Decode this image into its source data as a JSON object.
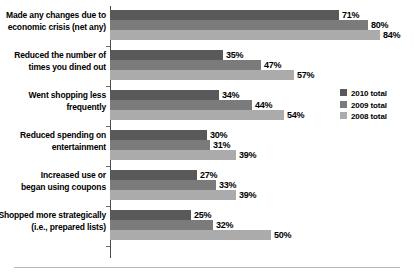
{
  "chart_data": {
    "type": "bar",
    "orientation": "horizontal",
    "title": "",
    "subtitle": "",
    "xlabel": "",
    "ylabel": "",
    "xlim": [
      0,
      90
    ],
    "grid": false,
    "legend_position": "middle-right",
    "value_suffix": "%",
    "categories": [
      "Made any changes due to economic crisis (net any)",
      "Reduced the number of times you dined out",
      "Went shopping less frequently",
      "Reduced spending on entertainment",
      "Increased use or began using coupons",
      "Shopped more strategically (i.e., prepared lists)"
    ],
    "category_lines": [
      [
        "Made any changes due to",
        "economic crisis (net any)"
      ],
      [
        "Reduced the number of",
        "times you dined out"
      ],
      [
        "Went shopping less",
        "frequently"
      ],
      [
        "Reduced spending on",
        "entertainment"
      ],
      [
        "Increased use or",
        "began using coupons"
      ],
      [
        "Shopped more strategically",
        "(i.e., prepared lists)"
      ]
    ],
    "series": [
      {
        "name": "2010 total",
        "color": "#595959",
        "values": [
          71,
          35,
          34,
          30,
          27,
          25
        ],
        "labels": [
          "71%",
          "35%",
          "34%",
          "30%",
          "27%",
          "25%"
        ]
      },
      {
        "name": "2009 total",
        "color": "#7b7b7b",
        "values": [
          80,
          47,
          44,
          31,
          33,
          32
        ],
        "labels": [
          "80%",
          "47%",
          "44%",
          "31%",
          "33%",
          "32%"
        ]
      },
      {
        "name": "2008 total",
        "color": "#ababab",
        "values": [
          84,
          57,
          54,
          39,
          39,
          50
        ],
        "labels": [
          "84%",
          "57%",
          "54%",
          "39%",
          "39%",
          "50%"
        ]
      }
    ]
  },
  "legend": {
    "items": [
      {
        "label": "2010 total",
        "color": "#595959"
      },
      {
        "label": "2009 total",
        "color": "#7b7b7b"
      },
      {
        "label": "2008 total",
        "color": "#ababab"
      }
    ]
  },
  "axis": {
    "line_color": "#4c4c4c"
  }
}
